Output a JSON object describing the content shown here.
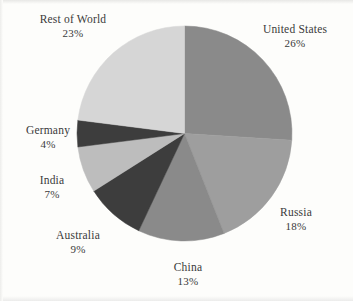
{
  "figure": {
    "background_color": "#fdfdfb",
    "text_color": "#3a3a3a"
  },
  "chart_data": {
    "type": "pie",
    "title": "",
    "xlabel": "",
    "ylabel": "",
    "legend_position": "none",
    "grid": false,
    "labels_outside": true,
    "start_angle_deg": 0,
    "direction": "clockwise",
    "categories": [
      "United States",
      "Russia",
      "China",
      "Australia",
      "India",
      "Germany",
      "Rest of World"
    ],
    "values": [
      26,
      18,
      13,
      9,
      7,
      4,
      23
    ],
    "value_suffix": "%",
    "colors": [
      "#8a8a8a",
      "#9e9e9e",
      "#8a8a8a",
      "#3d3d3d",
      "#bdbdbd",
      "#3d3d3d",
      "#d6d6d6"
    ],
    "slices": [
      {
        "name": "United States",
        "value": 26,
        "percent_label": "26%",
        "color": "#8a8a8a"
      },
      {
        "name": "Russia",
        "value": 18,
        "percent_label": "18%",
        "color": "#9e9e9e"
      },
      {
        "name": "China",
        "value": 13,
        "percent_label": "13%",
        "color": "#8a8a8a"
      },
      {
        "name": "Australia",
        "value": 9,
        "percent_label": "9%",
        "color": "#3d3d3d"
      },
      {
        "name": "India",
        "value": 7,
        "percent_label": "7%",
        "color": "#bdbdbd"
      },
      {
        "name": "Germany",
        "value": 4,
        "percent_label": "4%",
        "color": "#3d3d3d"
      },
      {
        "name": "Rest of World",
        "value": 23,
        "percent_label": "23%",
        "color": "#d6d6d6"
      }
    ]
  }
}
